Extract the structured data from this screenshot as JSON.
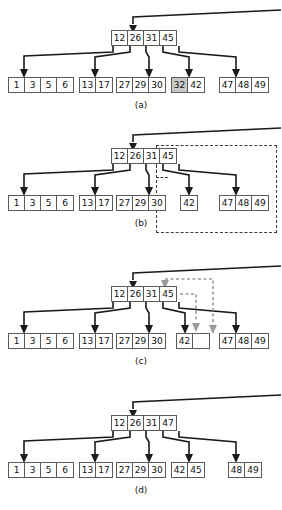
{
  "figure": {
    "panels": [
      {
        "id": "a",
        "caption": "(a)",
        "root": {
          "keys": [
            "12",
            "26",
            "31",
            "45"
          ]
        },
        "leaves": [
          {
            "cells": [
              {
                "value": "1"
              },
              {
                "value": "3"
              },
              {
                "value": "5"
              },
              {
                "value": "6"
              }
            ]
          },
          {
            "cells": [
              {
                "value": "13"
              },
              {
                "value": "17"
              }
            ]
          },
          {
            "cells": [
              {
                "value": "27"
              },
              {
                "value": "29"
              },
              {
                "value": "30"
              }
            ]
          },
          {
            "cells": [
              {
                "value": "32",
                "shaded": true
              },
              {
                "value": "42"
              }
            ]
          },
          {
            "cells": [
              {
                "value": "47"
              },
              {
                "value": "48"
              },
              {
                "value": "49"
              }
            ]
          }
        ]
      },
      {
        "id": "b",
        "caption": "(b)",
        "root": {
          "keys": [
            "12",
            "26",
            "31",
            "45"
          ]
        },
        "leaves": [
          {
            "cells": [
              {
                "value": "1"
              },
              {
                "value": "3"
              },
              {
                "value": "5"
              },
              {
                "value": "6"
              }
            ]
          },
          {
            "cells": [
              {
                "value": "13"
              },
              {
                "value": "17"
              }
            ]
          },
          {
            "cells": [
              {
                "value": "27"
              },
              {
                "value": "29"
              },
              {
                "value": "30"
              }
            ]
          },
          {
            "cells": [
              {
                "value": "42"
              }
            ]
          },
          {
            "cells": [
              {
                "value": "47"
              },
              {
                "value": "48"
              },
              {
                "value": "49"
              }
            ]
          }
        ]
      },
      {
        "id": "c",
        "caption": "(c)",
        "root": {
          "keys": [
            "12",
            "26",
            "31",
            "45"
          ]
        },
        "leaves": [
          {
            "cells": [
              {
                "value": "1"
              },
              {
                "value": "3"
              },
              {
                "value": "5"
              },
              {
                "value": "6"
              }
            ]
          },
          {
            "cells": [
              {
                "value": "13"
              },
              {
                "value": "17"
              }
            ]
          },
          {
            "cells": [
              {
                "value": "27"
              },
              {
                "value": "29"
              },
              {
                "value": "30"
              }
            ]
          },
          {
            "cells": [
              {
                "value": "42"
              },
              {
                "value": "",
                "empty": true
              }
            ]
          },
          {
            "cells": [
              {
                "value": "47"
              },
              {
                "value": "48"
              },
              {
                "value": "49"
              }
            ]
          }
        ]
      },
      {
        "id": "d",
        "caption": "(d)",
        "root": {
          "keys": [
            "12",
            "26",
            "31",
            "47"
          ]
        },
        "leaves": [
          {
            "cells": [
              {
                "value": "1"
              },
              {
                "value": "3"
              },
              {
                "value": "5"
              },
              {
                "value": "6"
              }
            ]
          },
          {
            "cells": [
              {
                "value": "13"
              },
              {
                "value": "17"
              }
            ]
          },
          {
            "cells": [
              {
                "value": "27"
              },
              {
                "value": "29"
              },
              {
                "value": "30"
              }
            ]
          },
          {
            "cells": [
              {
                "value": "42"
              },
              {
                "value": "45"
              }
            ]
          },
          {
            "cells": [
              {
                "value": "48"
              },
              {
                "value": "49"
              }
            ]
          }
        ]
      }
    ]
  },
  "colors": {
    "line": "#1a1a1a",
    "box_border": "#5a5a5a",
    "shade": "#c9c9c9",
    "highlight_dash": "#3a3a3a",
    "gray_dash": "#9a9a9a"
  }
}
